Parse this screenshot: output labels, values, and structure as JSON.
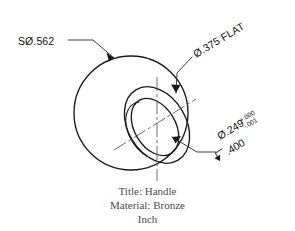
{
  "drawing": {
    "part_title": "Title: Handle",
    "material": "Material: Bronze",
    "units": "Inch",
    "stroke_color": "#1a1a1a",
    "background_color": "#ffffff"
  },
  "annotations": {
    "sphere_diameter": {
      "label": "SØ.562",
      "meaning": "spherical-diameter",
      "value": 0.562,
      "x": 18,
      "y": 41
    },
    "flat_diameter": {
      "label": "Ø.375 FLAT",
      "meaning": "flat-face-diameter",
      "value": 0.375,
      "rotation": -31
    },
    "hole_diameter": {
      "label": "Ø.249",
      "meaning": "hole-diameter",
      "value": 0.249,
      "tolerance_plus": "+.000",
      "tolerance_minus": "-.001",
      "rotation": -31
    },
    "hole_depth": {
      "symbol": "↧",
      "label": ".400",
      "meaning": "depth-of-hole",
      "value": 0.4,
      "rotation": -31
    }
  },
  "geometry": {
    "sphere": {
      "cx": 131,
      "cy": 113,
      "r": 57
    },
    "flat_face_ellipse": {
      "cx": 157,
      "cy": 125,
      "rx": 29,
      "ry": 41,
      "rotation": -31
    },
    "hole_ellipse": {
      "cx": 155,
      "cy": 127,
      "rx": 20,
      "ry": 31,
      "rotation": -31
    },
    "centerline_vertical": {
      "x": 157,
      "y1": 77,
      "y2": 181
    },
    "centerline_axis": {
      "x1": 114,
      "y1": 150,
      "x2": 196,
      "y2": 99
    }
  }
}
